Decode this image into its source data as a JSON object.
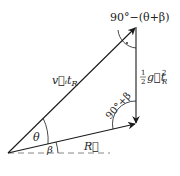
{
  "diagram": {
    "type": "vector-triangle",
    "colors": {
      "stroke": "#1a1a1a",
      "dashed": "#888888",
      "background": "#ffffff"
    },
    "points": {
      "origin": [
        8,
        153
      ],
      "apex": [
        136,
        27
      ],
      "bottom_right": [
        136,
        124
      ],
      "dashed_end": [
        110,
        153
      ]
    },
    "labels": {
      "velocity_vector": "v⃗ᵢt",
      "velocity_sub": "R",
      "gravity_coeff_num": "1",
      "gravity_coeff_den": "2",
      "gravity_vector": "g⃗t",
      "gravity_sup": "2",
      "gravity_sub": "R",
      "range_vector": "R⃗",
      "angle_theta": "θ",
      "angle_beta": "β",
      "angle_bottom_right": "90°+β",
      "angle_top": "90°−(θ+β)"
    }
  }
}
